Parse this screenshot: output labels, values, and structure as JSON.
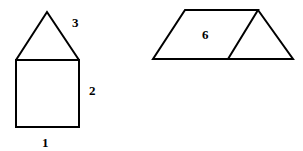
{
  "figures": {
    "house": {
      "labels": {
        "bottom": "1",
        "right": "2",
        "roof": "3"
      }
    },
    "prism_net": {
      "labels": {
        "face": "6"
      }
    }
  },
  "colors": {
    "stroke": "#000000",
    "background": "#ffffff"
  }
}
